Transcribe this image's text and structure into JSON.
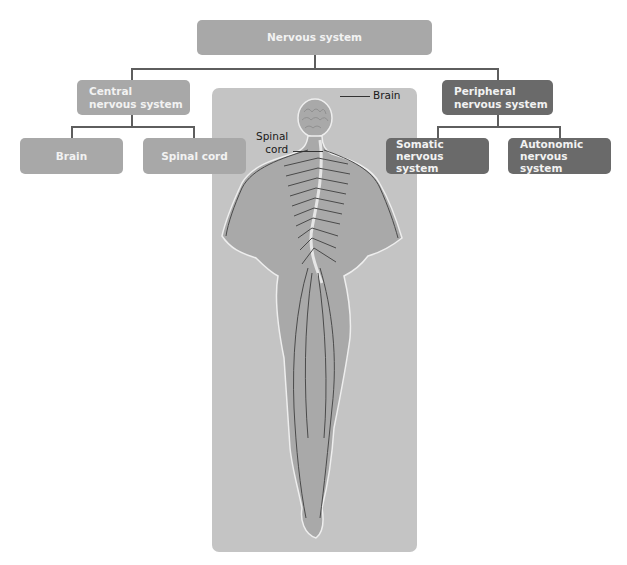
{
  "diagram": {
    "root": {
      "label": "Nervous system",
      "color": "#a8a8a8"
    },
    "branches": [
      {
        "label": "Central nervous system",
        "label_lines": [
          "Central",
          "nervous system"
        ],
        "color": "#a8a8a8",
        "children": [
          {
            "label": "Brain"
          },
          {
            "label": "Spinal cord"
          }
        ]
      },
      {
        "label": "Peripheral nervous system",
        "label_lines": [
          "Peripheral",
          "nervous system"
        ],
        "color": "#6a6a6a",
        "children": [
          {
            "label": "Somatic nervous system",
            "label_lines": [
              "Somatic nervous",
              "system"
            ]
          },
          {
            "label": "Autonomic nervous system",
            "label_lines": [
              "Autonomic",
              "nervous system"
            ]
          }
        ]
      }
    ]
  },
  "illustration": {
    "description": "Human figure from behind showing brain, spinal cord and peripheral nerves",
    "labels": [
      {
        "text": "Brain"
      },
      {
        "text_lines": [
          "Spinal",
          "cord"
        ]
      }
    ]
  }
}
